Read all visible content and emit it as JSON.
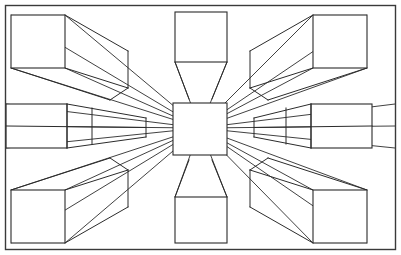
{
  "figure": {
    "kind": "line-diagram",
    "canvas": {
      "width": 401,
      "height": 255,
      "background": "#ffffff"
    },
    "ink_color": "#2b2b2b",
    "frame_color": "#3a3a3a",
    "vanishing_point": {
      "x": 200,
      "y": 128,
      "label": "vanishing point"
    },
    "frame": {
      "x": 5.5,
      "y": 5.5,
      "width": 390,
      "height": 244
    }
  },
  "chart_data": {
    "type": "line",
    "xlabel": "",
    "ylabel": "",
    "xlim": [
      0,
      401
    ],
    "ylim": [
      0,
      255
    ],
    "grid": false,
    "legend_position": "none",
    "annotations": [
      "All receding edges converge on a single vanishing point at (200,128).",
      "A square picture plane is drawn around the vanishing point.",
      "Eight boxes are arranged around the centre: four corner cubes, two side boxes, two vertical-axis boxes."
    ],
    "vanishing_point": {
      "x": 200,
      "y": 128
    },
    "center_square": {
      "x": 173,
      "y": 103,
      "width": 54,
      "height": 52
    },
    "boxes": [
      {
        "name": "top-left-box",
        "position": "top-left",
        "front_face": {
          "x": 11,
          "y": 15,
          "width": 54,
          "height": 53
        },
        "visible_faces": [
          "front",
          "right",
          "bottom"
        ],
        "receding_direction": "down-right toward vanishing point"
      },
      {
        "name": "top-center-box",
        "position": "top-center",
        "front_face": {
          "x": 175,
          "y": 12,
          "width": 52,
          "height": 50
        },
        "visible_faces": [
          "front",
          "bottom"
        ],
        "receding_direction": "down toward vanishing point"
      },
      {
        "name": "top-right-box",
        "position": "top-right",
        "front_face": {
          "x": 313,
          "y": 15,
          "width": 54,
          "height": 53
        },
        "visible_faces": [
          "front",
          "left",
          "bottom"
        ],
        "receding_direction": "down-left toward vanishing point"
      },
      {
        "name": "middle-left-box",
        "position": "middle-left",
        "front_face": {
          "x": 6,
          "y": 104,
          "width": 61,
          "height": 44
        },
        "visible_faces": [
          "front",
          "top",
          "bottom"
        ],
        "receding_direction": "right toward vanishing point",
        "cross_sections": [
          67,
          92
        ]
      },
      {
        "name": "middle-right-box",
        "position": "middle-right",
        "front_face": {
          "x": 311,
          "y": 104,
          "width": 61,
          "height": 44
        },
        "visible_faces": [
          "front",
          "top",
          "bottom"
        ],
        "receding_direction": "left toward vanishing point",
        "cross_sections": [
          311,
          286
        ]
      },
      {
        "name": "bottom-left-box",
        "position": "bottom-left",
        "front_face": {
          "x": 11,
          "y": 190,
          "width": 54,
          "height": 53
        },
        "visible_faces": [
          "front",
          "top",
          "right"
        ],
        "receding_direction": "up-right toward vanishing point"
      },
      {
        "name": "bottom-center-box",
        "position": "bottom-center",
        "front_face": {
          "x": 175,
          "y": 197,
          "width": 52,
          "height": 46
        },
        "visible_faces": [
          "front",
          "top"
        ],
        "receding_direction": "up toward vanishing point"
      },
      {
        "name": "bottom-right-box",
        "position": "bottom-right",
        "front_face": {
          "x": 313,
          "y": 190,
          "width": 54,
          "height": 53
        },
        "visible_faces": [
          "front",
          "top",
          "left"
        ],
        "receding_direction": "up-left toward vanishing point"
      }
    ],
    "ray_endpoints": [
      {
        "x": 11,
        "y": 15
      },
      {
        "x": 65,
        "y": 15
      },
      {
        "x": 11,
        "y": 68
      },
      {
        "x": 65,
        "y": 68
      },
      {
        "x": 175,
        "y": 62
      },
      {
        "x": 227,
        "y": 62
      },
      {
        "x": 313,
        "y": 15
      },
      {
        "x": 367,
        "y": 15
      },
      {
        "x": 313,
        "y": 68
      },
      {
        "x": 367,
        "y": 68
      },
      {
        "x": 6,
        "y": 104
      },
      {
        "x": 6,
        "y": 148
      },
      {
        "x": 6,
        "y": 126
      },
      {
        "x": 372,
        "y": 104
      },
      {
        "x": 372,
        "y": 148
      },
      {
        "x": 372,
        "y": 126
      },
      {
        "x": 11,
        "y": 190
      },
      {
        "x": 65,
        "y": 190
      },
      {
        "x": 11,
        "y": 243
      },
      {
        "x": 65,
        "y": 243
      },
      {
        "x": 175,
        "y": 197
      },
      {
        "x": 227,
        "y": 197
      },
      {
        "x": 313,
        "y": 190
      },
      {
        "x": 367,
        "y": 190
      },
      {
        "x": 313,
        "y": 243
      },
      {
        "x": 367,
        "y": 243
      }
    ]
  }
}
